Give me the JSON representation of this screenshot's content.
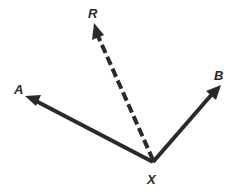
{
  "diagram": {
    "type": "geometry-angle-bisector",
    "vertex": {
      "label": "X",
      "x": 153,
      "y": 162
    },
    "rays": [
      {
        "name": "A",
        "label": "A",
        "style": "solid",
        "end": {
          "x": 27,
          "y": 97
        }
      },
      {
        "name": "R",
        "label": "R",
        "style": "dashed",
        "end": {
          "x": 95,
          "y": 25
        }
      },
      {
        "name": "B",
        "label": "B",
        "style": "solid",
        "end": {
          "x": 220,
          "y": 86
        }
      }
    ],
    "labels": {
      "A": "A",
      "R": "R",
      "B": "B",
      "X": "X"
    },
    "colors": {
      "stroke": "#2a2a2a",
      "background": "#ffffff"
    }
  }
}
